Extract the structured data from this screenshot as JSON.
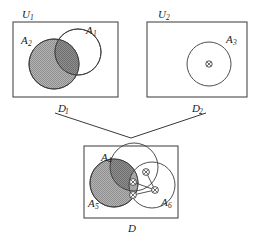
{
  "figure": {
    "width": 260,
    "height": 241,
    "background_color": "#ffffff",
    "line_color": "#3a3a3a",
    "shade_color": "#a8a8a8",
    "dark_shade_color": "#7d7d7d"
  },
  "panels": [
    {
      "id": "panel-u1",
      "universe_label": "U",
      "universe_sub": "1",
      "caption_label": "D",
      "caption_sub": "1",
      "box": {
        "x": 13,
        "y": 22,
        "w": 105,
        "h": 75
      },
      "sets": [
        {
          "name": "A",
          "sub": "1",
          "shaded": false,
          "cx": 78,
          "cy": 52,
          "r": 23
        },
        {
          "name": "A",
          "sub": "2",
          "shaded": true,
          "cx": 54,
          "cy": 64,
          "r": 25
        }
      ]
    },
    {
      "id": "panel-u2",
      "universe_label": "U",
      "universe_sub": "2",
      "caption_label": "D",
      "caption_sub": "2",
      "box": {
        "x": 147,
        "y": 22,
        "w": 100,
        "h": 75
      },
      "sets": [
        {
          "name": "A",
          "sub": "3",
          "shaded": false,
          "cx": 209,
          "cy": 64,
          "r": 22
        }
      ],
      "markers": [
        {
          "name": "node",
          "cx": 209,
          "cy": 64,
          "r": 3.2
        }
      ]
    },
    {
      "id": "panel-d",
      "universe_label": "",
      "universe_sub": "",
      "caption_label": "D",
      "caption_sub": "",
      "box": {
        "x": 84,
        "y": 146,
        "w": 94,
        "h": 72
      },
      "sets": [
        {
          "name": "A",
          "sub": "4",
          "shaded": false,
          "cx": 134,
          "cy": 167,
          "r": 24
        },
        {
          "name": "A",
          "sub": "5",
          "shaded": true,
          "cx": 114,
          "cy": 183,
          "r": 24
        },
        {
          "name": "A",
          "sub": "6",
          "shaded": false,
          "cx": 152,
          "cy": 185,
          "r": 23
        }
      ],
      "markers": [
        {
          "name": "node",
          "cx": 146,
          "cy": 172,
          "r": 3.4
        },
        {
          "name": "node",
          "cx": 133,
          "cy": 182,
          "r": 3.4
        },
        {
          "name": "node",
          "cx": 133,
          "cy": 195,
          "r": 3.4
        },
        {
          "name": "node",
          "cx": 155,
          "cy": 190,
          "r": 3.4
        }
      ],
      "edges": [
        {
          "from": 0,
          "to": 3
        },
        {
          "from": 1,
          "to": 3
        },
        {
          "from": 2,
          "to": 3
        }
      ]
    }
  ],
  "connector": {
    "name": "merge-connector",
    "description": "V-shaped lines joining D1 and D2 down to D",
    "left_start": [
      52,
      113
    ],
    "apex": [
      131,
      137
    ],
    "right_start": [
      208,
      113
    ]
  },
  "labels": {
    "u1": "U",
    "u1_sub": "1",
    "u2": "U",
    "u2_sub": "2",
    "d1": "D",
    "d1_sub": "1",
    "d2": "D",
    "d2_sub": "2",
    "d": "D",
    "a1": "A",
    "a1_sub": "1",
    "a2": "A",
    "a2_sub": "2",
    "a3": "A",
    "a3_sub": "3",
    "a4": "A",
    "a4_sub": "4",
    "a5": "A",
    "a5_sub": "5",
    "a6": "A",
    "a6_sub": "6"
  }
}
